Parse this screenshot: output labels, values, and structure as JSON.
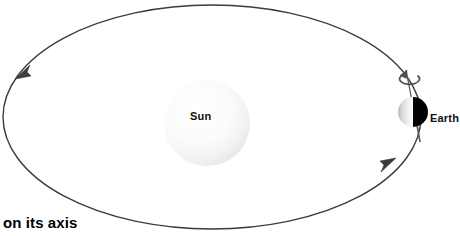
{
  "figure": {
    "type": "astronomy-diagram",
    "canvas": {
      "width": 460,
      "height": 236,
      "background": "#ffffff"
    }
  },
  "labels": {
    "sun": "Sun",
    "earth": "Earth",
    "caption": "on its axis"
  },
  "bodies": {
    "sun": {
      "name": "Sun",
      "center_x": 207,
      "center_y": 123,
      "radius": 43,
      "fill_light": "#ffffff",
      "fill_edge": "#e9e9e9"
    },
    "earth": {
      "name": "Earth",
      "center_x": 413,
      "center_y": 112,
      "radius": 15,
      "lit_side": "left",
      "lit_color": "#e2e2e2",
      "dark_color": "#000000",
      "axis_tilt_degrees": 9
    }
  },
  "orbit": {
    "name": "orbital-path",
    "center_x": 212,
    "center_y": 117,
    "radius_x": 209,
    "radius_y": 112,
    "stroke": "#3c3c3c",
    "stroke_width": 1.4,
    "direction": "counterclockwise",
    "arrowheads": [
      {
        "name": "orbit-arrow-left",
        "x": 23,
        "y": 72,
        "points": "down-left"
      },
      {
        "name": "orbit-arrow-right",
        "x": 388,
        "y": 166,
        "points": "up-right"
      }
    ]
  },
  "rotation_arrow": {
    "name": "earth-spin-arrow",
    "center_x": 408,
    "center_y": 78,
    "radius_x": 10,
    "radius_y": 5,
    "stroke": "#4a4a4a",
    "direction": "counterclockwise"
  },
  "earth_axis": {
    "name": "earth-axis-line",
    "top_x": 406,
    "top_y": 70,
    "bottom_x": 420,
    "bottom_y": 142,
    "stroke": "#555555"
  },
  "colors": {
    "orbit_stroke": "#3c3c3c",
    "earth_dark": "#000000",
    "earth_lit": "#e2e2e2",
    "text": "#111111",
    "background": "#ffffff"
  }
}
